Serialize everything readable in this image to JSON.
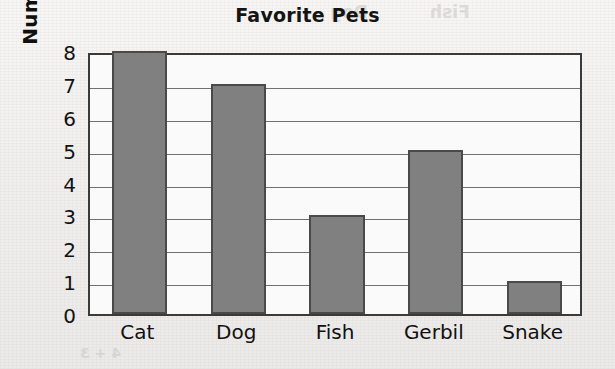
{
  "chart_data": {
    "type": "bar",
    "title": "Favorite Pets",
    "xlabel": "",
    "ylabel": "Number of Kids",
    "categories": [
      "Cat",
      "Dog",
      "Fish",
      "Gerbil",
      "Snake"
    ],
    "values": [
      8,
      7,
      3,
      5,
      1
    ],
    "ylim": [
      0,
      8
    ],
    "ytick_labels": [
      "8",
      "7",
      "6",
      "5",
      "4",
      "3",
      "2",
      "1",
      "0"
    ],
    "ytick_values": [
      8,
      7,
      6,
      5,
      4,
      3,
      2,
      1,
      0
    ],
    "grid": "horizontal",
    "legend": "none",
    "bar_color": "#808080",
    "bar_edge_color": "#4a4a4a",
    "gridline_color": "#72706e",
    "axis_color": "#3a3a3a",
    "plot_background": "#fbfafa",
    "page_background": "#f2f1ef",
    "text_color": "#111111"
  },
  "artifacts": {
    "ghost_texts": [
      {
        "text": "Dog",
        "left": 330,
        "top": 2,
        "size": 17
      },
      {
        "text": "Fish",
        "left": 430,
        "top": 2,
        "size": 17
      },
      {
        "text": "9 = 16",
        "left": 455,
        "top": 96,
        "size": 15
      },
      {
        "text": "3 = 12",
        "left": 455,
        "top": 140,
        "size": 15
      },
      {
        "text": "Dogs",
        "left": 455,
        "top": 182,
        "size": 15
      },
      {
        "text": "Gerbil",
        "left": 418,
        "top": 235,
        "size": 15
      },
      {
        "text": "4 + 3",
        "left": 80,
        "top": 345,
        "size": 14
      }
    ]
  }
}
